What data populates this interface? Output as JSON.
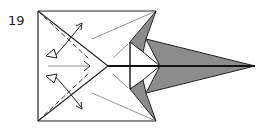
{
  "diagram": {
    "type": "origami-folding-step",
    "step_number": "19",
    "colors": {
      "paper_white": "#ffffff",
      "paper_colored": "#8c8c8c",
      "line": "#222222",
      "guide_line": "#555555"
    },
    "elements": [
      "square-base-outline",
      "diagonal-folds-to-center-point",
      "dashed-valley-fold-lines",
      "double-headed-fold-unfold-arrows",
      "center-push-arrow",
      "shaded-long-point-to-right",
      "shaded-side-flaps"
    ]
  }
}
